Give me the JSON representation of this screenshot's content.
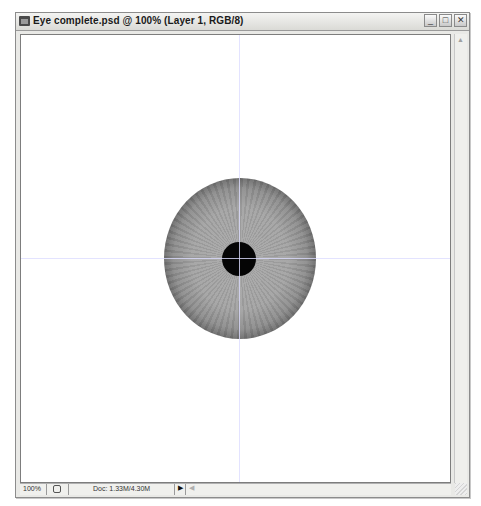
{
  "window": {
    "title": "Eye complete.psd @ 100% (Layer 1, RGB/8)",
    "buttons": {
      "minimize": "_",
      "maximize": "□",
      "close": "✕"
    }
  },
  "canvas": {
    "guides": {
      "vertical": true,
      "horizontal": true
    },
    "artwork": {
      "iris_color": "#a3a3a3",
      "iris_edge_color": "#141414",
      "pupil_color": "#050505"
    }
  },
  "scrollbar": {
    "up_arrow": "▲"
  },
  "statusbar": {
    "zoom": "100%",
    "doc_info": "Doc: 1.33M/4.30M",
    "menu_arrow": "▶",
    "scroll_left": "◀"
  }
}
